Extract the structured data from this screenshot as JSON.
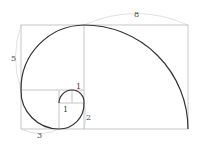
{
  "diagram": {
    "labels": {
      "square_8": "8",
      "square_5": "5",
      "square_3": "3",
      "square_2": "2",
      "square_1a": "1",
      "square_1b": "1"
    },
    "colors": {
      "grid": "#b8b8b8",
      "spiral": "#333333",
      "dimension": "#cccccc",
      "label": "#444444"
    }
  }
}
